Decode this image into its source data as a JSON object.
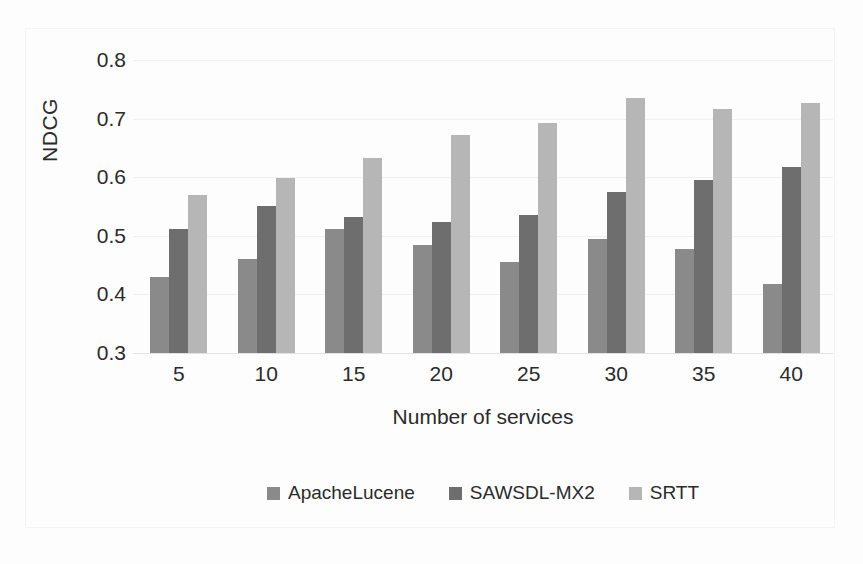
{
  "chart_data": {
    "type": "bar",
    "title": "",
    "xlabel": "Number of services",
    "ylabel": "NDCG",
    "categories": [
      "5",
      "10",
      "15",
      "20",
      "25",
      "30",
      "35",
      "40"
    ],
    "ylim": [
      0.3,
      0.8
    ],
    "ytick_labels": [
      "0.8",
      "0.7",
      "0.6",
      "0.5",
      "0.4",
      "0.3"
    ],
    "yticks": [
      0.8,
      0.7,
      0.6,
      0.5,
      0.4,
      0.3
    ],
    "grid": true,
    "legend_position": "bottom",
    "series": [
      {
        "name": "ApacheLucene",
        "color": "#8a8a8a",
        "values": [
          0.43,
          0.461,
          0.511,
          0.484,
          0.455,
          0.495,
          0.477,
          0.417
        ]
      },
      {
        "name": "SAWSDL-MX2",
        "color": "#6e6e6e",
        "values": [
          0.511,
          0.551,
          0.532,
          0.523,
          0.535,
          0.575,
          0.596,
          0.617
        ]
      },
      {
        "name": "SRTT",
        "color": "#b6b6b6",
        "values": [
          0.569,
          0.598,
          0.632,
          0.672,
          0.693,
          0.735,
          0.716,
          0.726
        ]
      }
    ]
  }
}
